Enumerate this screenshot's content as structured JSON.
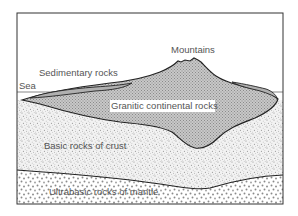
{
  "diagram": {
    "type": "geological cross-section",
    "labels": {
      "mountains": "Mountains",
      "sedimentary": "Sedimentary rocks",
      "sea": "Sea",
      "granitic": "Granitic continental rocks",
      "basic": "Basic rocks of crust",
      "ultrabasic": "Ultrabasic rocks of mantle"
    },
    "layers": [
      {
        "name": "Sea",
        "fill": "none"
      },
      {
        "name": "Sedimentary rocks",
        "fill": "#b0b0b0"
      },
      {
        "name": "Granitic continental rocks",
        "fill": "crosshatch-gray"
      },
      {
        "name": "Basic rocks of crust",
        "fill": "fine-stipple"
      },
      {
        "name": "Ultrabasic rocks of mantle",
        "fill": "coarse-dots"
      }
    ]
  }
}
